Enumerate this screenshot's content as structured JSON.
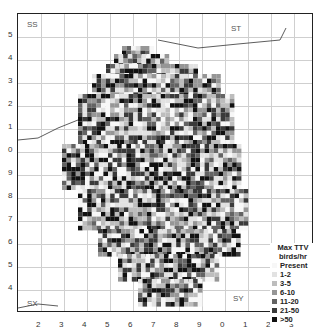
{
  "map": {
    "squares": [
      "SS",
      "ST",
      "SX",
      "SY"
    ],
    "y_ticks": [
      "5",
      "4",
      "3",
      "2",
      "1",
      "0",
      "9",
      "8",
      "7",
      "6",
      "5",
      "4"
    ],
    "x_ticks": [
      "2",
      "3",
      "4",
      "5",
      "6",
      "7",
      "8",
      "9",
      "0",
      "1",
      "2",
      "3"
    ]
  },
  "legend": {
    "title": "Max TTV birds/hr",
    "items": [
      {
        "label": "Present",
        "color": "#f7f7f7"
      },
      {
        "label": "1-2",
        "color": "#e2e2e2"
      },
      {
        "label": "3-5",
        "color": "#bdbdbd"
      },
      {
        "label": "6-10",
        "color": "#969696"
      },
      {
        "label": "11-20",
        "color": "#636363"
      },
      {
        "label": "21-50",
        "color": "#3a3a3a"
      },
      {
        "label": ">50",
        "color": "#111111"
      }
    ]
  }
}
